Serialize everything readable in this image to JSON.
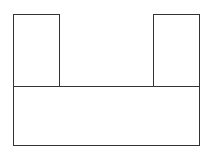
{
  "diagram": {
    "stroke_color": "#333333",
    "background": "#ffffff",
    "shapes": [
      {
        "name": "left-upright",
        "x": 13,
        "y": 14,
        "width": 46,
        "height": 72
      },
      {
        "name": "right-upright",
        "x": 153,
        "y": 14,
        "width": 46,
        "height": 72
      },
      {
        "name": "base",
        "x": 13,
        "y": 86,
        "width": 186,
        "height": 59
      }
    ]
  }
}
